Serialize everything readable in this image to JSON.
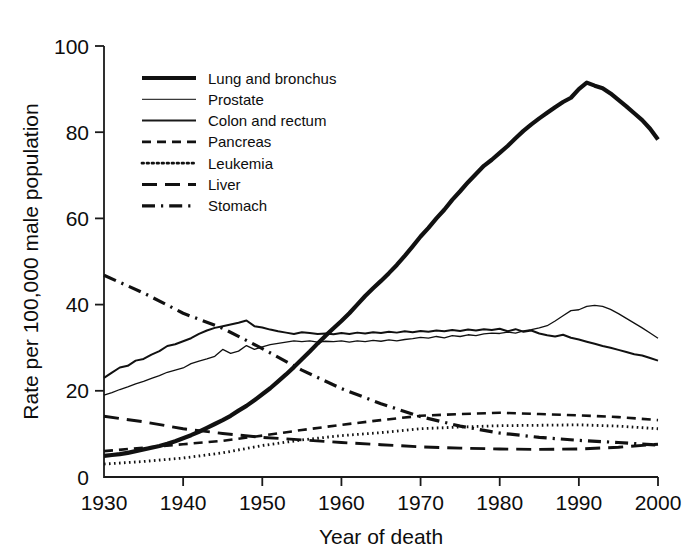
{
  "chart_data": {
    "type": "line",
    "title": "",
    "xlabel": "Year of death",
    "ylabel": "Rate per 100,000 male population",
    "xlim": [
      1930,
      2000
    ],
    "ylim": [
      0,
      100
    ],
    "xticks": [
      1930,
      1940,
      1950,
      1960,
      1970,
      1980,
      1990,
      2000
    ],
    "yticks": [
      0,
      20,
      40,
      60,
      80,
      100
    ],
    "grid": false,
    "legend_position": "upper-left-inside",
    "series": [
      {
        "name": "Lung and bronchus",
        "style": "solid-thick",
        "color": "#111111",
        "x": [
          1930,
          1931,
          1932,
          1933,
          1934,
          1935,
          1936,
          1937,
          1938,
          1939,
          1940,
          1941,
          1942,
          1943,
          1944,
          1945,
          1946,
          1947,
          1948,
          1949,
          1950,
          1951,
          1952,
          1953,
          1954,
          1955,
          1956,
          1957,
          1958,
          1959,
          1960,
          1961,
          1962,
          1963,
          1964,
          1965,
          1966,
          1967,
          1968,
          1969,
          1970,
          1971,
          1972,
          1973,
          1974,
          1975,
          1976,
          1977,
          1978,
          1979,
          1980,
          1981,
          1982,
          1983,
          1984,
          1985,
          1986,
          1987,
          1988,
          1989,
          1990,
          1991,
          1992,
          1993,
          1994,
          1995,
          1996,
          1997,
          1998,
          1999,
          2000
        ],
        "y": [
          4.9,
          5.1,
          5.3,
          5.6,
          6.0,
          6.4,
          6.8,
          7.2,
          7.7,
          8.3,
          9.0,
          9.7,
          10.5,
          11.4,
          12.3,
          13.2,
          14.2,
          15.4,
          16.5,
          17.8,
          19.2,
          20.6,
          22.2,
          23.8,
          25.5,
          27.3,
          29.1,
          31.0,
          32.8,
          34.5,
          36.2,
          38.0,
          40.0,
          42.0,
          43.8,
          45.5,
          47.3,
          49.2,
          51.3,
          53.5,
          55.8,
          57.8,
          60.0,
          62.0,
          64.3,
          66.3,
          68.4,
          70.3,
          72.2,
          73.6,
          75.2,
          76.8,
          78.6,
          80.3,
          81.8,
          83.2,
          84.5,
          85.8,
          87.0,
          88.0,
          90.0,
          91.5,
          90.8,
          90.2,
          89.0,
          87.5,
          86.0,
          84.4,
          82.8,
          80.8,
          78.3
        ]
      },
      {
        "name": "Prostate",
        "style": "solid-thin",
        "color": "#3a3a3a",
        "x": [
          1930,
          1931,
          1932,
          1933,
          1934,
          1935,
          1936,
          1937,
          1938,
          1939,
          1940,
          1941,
          1942,
          1943,
          1944,
          1945,
          1946,
          1947,
          1948,
          1949,
          1950,
          1951,
          1952,
          1953,
          1954,
          1955,
          1956,
          1957,
          1958,
          1959,
          1960,
          1961,
          1962,
          1963,
          1964,
          1965,
          1966,
          1967,
          1968,
          1969,
          1970,
          1971,
          1972,
          1973,
          1974,
          1975,
          1976,
          1977,
          1978,
          1979,
          1980,
          1981,
          1982,
          1983,
          1984,
          1985,
          1986,
          1987,
          1988,
          1989,
          1990,
          1991,
          1992,
          1993,
          1994,
          1995,
          1996,
          1997,
          1998,
          1999,
          2000
        ],
        "y": [
          19.0,
          19.6,
          20.3,
          20.9,
          21.6,
          22.2,
          22.9,
          23.5,
          24.3,
          24.8,
          25.3,
          26.3,
          26.9,
          27.4,
          28.0,
          29.6,
          28.7,
          29.2,
          30.5,
          29.6,
          30.2,
          30.7,
          31.0,
          31.3,
          31.6,
          31.4,
          31.6,
          31.3,
          31.5,
          31.4,
          31.6,
          31.3,
          31.6,
          31.4,
          31.7,
          31.5,
          31.8,
          31.6,
          31.9,
          32.1,
          32.4,
          32.2,
          32.6,
          32.3,
          32.8,
          32.6,
          33.0,
          32.8,
          33.2,
          33.4,
          33.3,
          33.6,
          33.4,
          33.9,
          34.2,
          34.6,
          35.1,
          36.2,
          37.4,
          38.6,
          38.8,
          39.6,
          39.8,
          39.6,
          38.9,
          37.9,
          36.8,
          35.7,
          34.6,
          33.4,
          32.2
        ]
      },
      {
        "name": "Colon and rectum",
        "style": "solid-medium",
        "color": "#1a1a1a",
        "x": [
          1930,
          1931,
          1932,
          1933,
          1934,
          1935,
          1936,
          1937,
          1938,
          1939,
          1940,
          1941,
          1942,
          1943,
          1944,
          1945,
          1946,
          1947,
          1948,
          1949,
          1950,
          1951,
          1952,
          1953,
          1954,
          1955,
          1956,
          1957,
          1958,
          1959,
          1960,
          1961,
          1962,
          1963,
          1964,
          1965,
          1966,
          1967,
          1968,
          1969,
          1970,
          1971,
          1972,
          1973,
          1974,
          1975,
          1976,
          1977,
          1978,
          1979,
          1980,
          1981,
          1982,
          1983,
          1984,
          1985,
          1986,
          1987,
          1988,
          1989,
          1990,
          1991,
          1992,
          1993,
          1994,
          1995,
          1996,
          1997,
          1998,
          1999,
          2000
        ],
        "y": [
          23.0,
          24.2,
          25.4,
          25.8,
          27.0,
          27.4,
          28.4,
          29.2,
          30.4,
          30.8,
          31.5,
          32.2,
          33.2,
          34.0,
          34.6,
          35.0,
          35.4,
          35.8,
          36.3,
          35.0,
          34.7,
          34.2,
          33.8,
          33.5,
          33.2,
          33.6,
          33.4,
          33.2,
          33.3,
          33.1,
          33.4,
          33.2,
          33.5,
          33.3,
          33.6,
          33.4,
          33.7,
          33.5,
          33.8,
          33.6,
          33.9,
          33.7,
          34.0,
          33.8,
          34.1,
          33.9,
          34.2,
          34.0,
          34.3,
          34.1,
          34.4,
          33.8,
          34.3,
          33.7,
          34.0,
          33.3,
          32.9,
          32.6,
          33.0,
          32.3,
          31.9,
          31.4,
          30.9,
          30.4,
          30.0,
          29.5,
          29.0,
          28.5,
          28.2,
          27.6,
          27.0
        ]
      },
      {
        "name": "Pancreas",
        "style": "dashed-short",
        "color": "#111111",
        "x": [
          1930,
          1935,
          1940,
          1945,
          1950,
          1955,
          1960,
          1965,
          1970,
          1975,
          1980,
          1985,
          1990,
          1995,
          2000
        ],
        "y": [
          6.0,
          6.8,
          7.6,
          8.4,
          9.6,
          10.9,
          12.1,
          13.2,
          14.2,
          14.6,
          14.9,
          14.6,
          14.3,
          13.9,
          13.2
        ]
      },
      {
        "name": "Leukemia",
        "style": "dotted",
        "color": "#111111",
        "x": [
          1930,
          1935,
          1940,
          1945,
          1950,
          1955,
          1960,
          1965,
          1970,
          1975,
          1980,
          1985,
          1990,
          1995,
          2000
        ],
        "y": [
          3.0,
          3.6,
          4.4,
          5.6,
          7.3,
          8.6,
          9.6,
          10.3,
          11.2,
          11.6,
          11.9,
          12.0,
          12.1,
          11.8,
          11.2
        ]
      },
      {
        "name": "Liver",
        "style": "dashed-long",
        "color": "#111111",
        "x": [
          1930,
          1935,
          1940,
          1945,
          1950,
          1955,
          1960,
          1965,
          1970,
          1975,
          1980,
          1985,
          1990,
          1995,
          2000
        ],
        "y": [
          14.1,
          12.8,
          11.2,
          10.1,
          9.2,
          8.6,
          8.0,
          7.5,
          7.0,
          6.7,
          6.5,
          6.4,
          6.5,
          6.9,
          7.6
        ]
      },
      {
        "name": "Stomach",
        "style": "dash-dot",
        "color": "#111111",
        "x": [
          1930,
          1935,
          1940,
          1945,
          1950,
          1955,
          1960,
          1965,
          1970,
          1975,
          1980,
          1985,
          1990,
          1995,
          2000
        ],
        "y": [
          46.8,
          42.7,
          38.0,
          34.5,
          29.8,
          24.8,
          20.5,
          17.0,
          14.0,
          11.8,
          10.2,
          9.2,
          8.5,
          8.0,
          7.4
        ]
      }
    ]
  },
  "axis": {
    "x_tick_labels": [
      "1930",
      "1940",
      "1950",
      "1960",
      "1970",
      "1980",
      "1990",
      "2000"
    ],
    "y_tick_labels": [
      "0",
      "20",
      "40",
      "60",
      "80",
      "100"
    ],
    "x_title": "Year of death",
    "y_title": "Rate per 100,000 male population"
  },
  "legend": {
    "items": [
      {
        "label": "Lung and bronchus",
        "style": "solid-thick"
      },
      {
        "label": "Prostate",
        "style": "solid-thin"
      },
      {
        "label": "Colon and rectum",
        "style": "solid-medium"
      },
      {
        "label": "Pancreas",
        "style": "dashed-short"
      },
      {
        "label": "Leukemia",
        "style": "dotted"
      },
      {
        "label": "Liver",
        "style": "dashed-long"
      },
      {
        "label": "Stomach",
        "style": "dash-dot"
      }
    ]
  },
  "colors": {
    "ink": "#111111",
    "background": "#ffffff",
    "thin_line": "#3a3a3a"
  }
}
